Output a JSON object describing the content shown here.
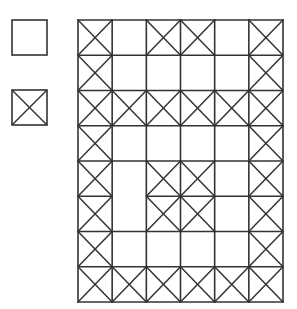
{
  "legend": {
    "items": [
      {
        "label": "",
        "symbol": "empty-square",
        "crossed": false,
        "x": 12,
        "y": 20,
        "size": 35
      },
      {
        "label": "",
        "symbol": "crossed-square",
        "crossed": true,
        "x": 12,
        "y": 90,
        "size": 35
      }
    ]
  },
  "grid": {
    "x": 78,
    "y": 20,
    "width": 205,
    "height": 282,
    "cols": 6,
    "rows": 8,
    "line_color": "#333333",
    "cells": [
      [
        1,
        0,
        1,
        1,
        0,
        1
      ],
      [
        1,
        0,
        0,
        0,
        0,
        1
      ],
      [
        1,
        1,
        1,
        1,
        1,
        1
      ],
      [
        1,
        0,
        0,
        0,
        0,
        1
      ],
      [
        1,
        0,
        1,
        1,
        0,
        1
      ],
      [
        1,
        0,
        1,
        1,
        0,
        1
      ],
      [
        1,
        0,
        0,
        0,
        0,
        1
      ],
      [
        1,
        1,
        1,
        1,
        1,
        1
      ]
    ],
    "merged_cells": [
      {
        "row_start": 4,
        "row_end": 5,
        "col": 1,
        "note": "no horizontal divider between rows 5 and 6 in column 2"
      }
    ]
  }
}
